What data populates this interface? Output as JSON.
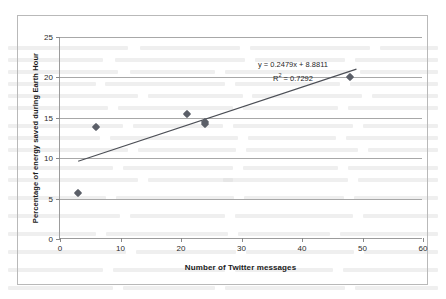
{
  "chart_data": {
    "type": "scatter",
    "title": "",
    "xlabel": "Number of Twitter messages",
    "ylabel": "Percentage of energy saved during Earth Hour",
    "xlim": [
      0,
      60
    ],
    "ylim": [
      0,
      25
    ],
    "xticks": [
      "0",
      "10",
      "20",
      "30",
      "40",
      "50",
      "60"
    ],
    "yticks": [
      "0",
      "5",
      "10",
      "15",
      "20",
      "25"
    ],
    "xtick_values": [
      0,
      10,
      20,
      30,
      40,
      50,
      60
    ],
    "ytick_values": [
      0,
      5,
      10,
      15,
      20,
      25
    ],
    "grid": "horizontal",
    "legend": "none",
    "series": [
      {
        "name": "Earth Hour data",
        "marker": "diamond",
        "color": "#5b5f68",
        "points": [
          {
            "x": 3,
            "y": 5.7
          },
          {
            "x": 6,
            "y": 13.8
          },
          {
            "x": 21,
            "y": 15.5
          },
          {
            "x": 24,
            "y": 14.5
          },
          {
            "x": 24,
            "y": 14.2
          },
          {
            "x": 48,
            "y": 20.1
          }
        ]
      }
    ],
    "trendline": {
      "type": "linear",
      "slope": 0.2479,
      "intercept": 8.8811,
      "r_squared": 0.7292,
      "x_start": 3,
      "x_end": 49,
      "color": "#4c4f56"
    },
    "annotations": {
      "equation_line": "y = 0.2479x + 8.8811",
      "r2_prefix": "R",
      "r2_exponent": "2",
      "r2_value": " = 0.7292"
    }
  },
  "colors": {
    "marker": "#5b5f68",
    "trendline": "#4c4f56",
    "gridline": "#a8a8a8",
    "axis": "#9c9c9c",
    "frame_border": "#b9b9b9",
    "text": "#1a1a1a"
  }
}
